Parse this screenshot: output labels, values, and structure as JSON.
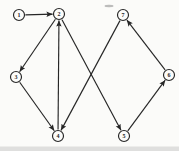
{
  "figure": {
    "type": "directed-graph",
    "canvas": {
      "width": 179,
      "height": 151
    },
    "colors": {
      "paper": "#fbfbf9",
      "ink": "#262626",
      "node_fill": "#fcfcfa",
      "bottom_band": "#c9c9c9",
      "smudge": "#9a9a9a"
    },
    "node_radius": 5.5,
    "nodes": [
      {
        "id": "n1",
        "label": "1",
        "x": 19,
        "y": 15
      },
      {
        "id": "n2",
        "label": "2",
        "x": 59,
        "y": 14
      },
      {
        "id": "n3",
        "label": "3",
        "x": 16,
        "y": 77
      },
      {
        "id": "n4",
        "label": "4",
        "x": 58,
        "y": 136
      },
      {
        "id": "n5",
        "label": "5",
        "x": 124,
        "y": 136
      },
      {
        "id": "n6",
        "label": "6",
        "x": 169,
        "y": 75
      },
      {
        "id": "n7",
        "label": "7",
        "x": 123,
        "y": 15
      }
    ],
    "edges": [
      {
        "from": "1",
        "to": "2"
      },
      {
        "from": "2",
        "to": "3"
      },
      {
        "from": "2",
        "to": "5"
      },
      {
        "from": "3",
        "to": "4"
      },
      {
        "from": "4",
        "to": "2"
      },
      {
        "from": "5",
        "to": "6"
      },
      {
        "from": "6",
        "to": "7"
      },
      {
        "from": "7",
        "to": "4"
      }
    ],
    "artifacts": {
      "bottom_band": {
        "x": 0,
        "y": 146.5,
        "width": 179,
        "height": 4.5,
        "opacity": 0.55
      },
      "smudge": {
        "cx": 109,
        "cy": 6,
        "rx": 4.5,
        "ry": 1.2,
        "opacity": 0.65
      }
    }
  }
}
